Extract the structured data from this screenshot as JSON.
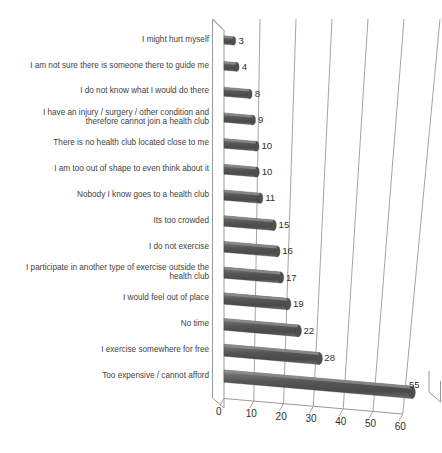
{
  "chart_data": {
    "type": "bar",
    "orientation": "horizontal",
    "style": "3d-cylinder",
    "title": "",
    "xlabel": "",
    "ylabel": "",
    "xlim": [
      0,
      60
    ],
    "xticks": [
      0,
      10,
      20,
      30,
      40,
      50,
      60
    ],
    "xtick_labels": [
      "0",
      "10",
      "20",
      "30",
      "40",
      "50",
      "60"
    ],
    "grid": true,
    "legend": false,
    "categories": [
      "I might hurt myself",
      "I am not sure there is someone there to guide me",
      "I do not know what I would do there",
      "I have an injury / surgery / other condition and\ntherefore cannot join a health club",
      "There is no health club located close to me",
      "I am too out of shape to even think about it",
      "Nobody I know goes to a health club",
      "Its too crowded",
      "I do not exercise",
      "I participate in another type of exercise outside the\nhealth club",
      "I would feel out of place",
      "No time",
      "I exercise somewhere for free",
      "Too expensive / cannot afford"
    ],
    "values": [
      3,
      4,
      8,
      9,
      10,
      10,
      11,
      15,
      16,
      17,
      19,
      22,
      28,
      55
    ],
    "value_labels": [
      "3",
      "4",
      "8",
      "9",
      "10",
      "10",
      "11",
      "15",
      "16",
      "17",
      "19",
      "22",
      "28",
      "55"
    ],
    "bar_color": "#595959",
    "bar_highlight_color": "#8c8c8c",
    "axis_color": "#9a9a9a",
    "text_color": "#3f3f3f",
    "background_color": "#ffffff"
  }
}
